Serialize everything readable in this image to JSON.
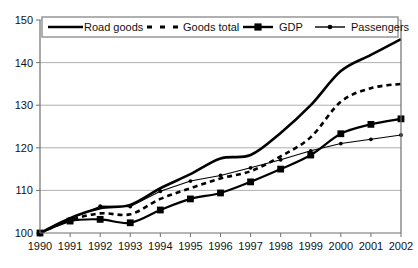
{
  "chart_data": {
    "type": "line",
    "title": "",
    "subtitle": "",
    "xlabel": "",
    "ylabel": "",
    "grid": true,
    "legend_position": "top-inside",
    "x": [
      1990,
      1991,
      1992,
      1993,
      1994,
      1995,
      1996,
      1997,
      1998,
      1999,
      2000,
      2001,
      2002
    ],
    "xtick_labels": [
      "1990",
      "1991",
      "1992",
      "1993",
      "1994",
      "1995",
      "1996",
      "1997",
      "1998",
      "1999",
      "2000",
      "2001",
      "2002"
    ],
    "xlim": [
      1990,
      2002
    ],
    "ylim": [
      100,
      150
    ],
    "ytick_labels": [
      "100",
      "110",
      "120",
      "130",
      "140",
      "150"
    ],
    "yticks": [
      100,
      110,
      120,
      130,
      140,
      150
    ],
    "series": [
      {
        "name": "Road goods",
        "style": "solid-thick",
        "marker": "none",
        "color": "#000000",
        "values": [
          100.0,
          103.5,
          105.8,
          106.6,
          110.5,
          113.8,
          117.5,
          118.3,
          123.5,
          130.0,
          138.0,
          141.8,
          145.5
        ]
      },
      {
        "name": "Goods total",
        "style": "dashed",
        "marker": "none",
        "color": "#000000",
        "values": [
          100.0,
          103.0,
          104.6,
          104.4,
          108.0,
          110.5,
          112.8,
          114.5,
          118.0,
          122.5,
          130.8,
          134.0,
          135.0
        ]
      },
      {
        "name": "GDP",
        "style": "solid",
        "marker": "square",
        "color": "#000000",
        "values": [
          100.0,
          102.8,
          103.2,
          102.4,
          105.4,
          108.0,
          109.4,
          112.0,
          115.0,
          118.3,
          123.3,
          125.5,
          126.8
        ]
      },
      {
        "name": "Passengers",
        "style": "thin",
        "marker": "dot",
        "color": "#000000",
        "values": [
          100.0,
          103.3,
          106.3,
          106.2,
          109.8,
          112.2,
          113.5,
          115.3,
          117.2,
          119.3,
          121.0,
          122.0,
          123.0
        ]
      }
    ]
  },
  "axis": {
    "y_labels": [
      "150",
      "140",
      "130",
      "120",
      "110",
      "100"
    ],
    "x_labels": [
      "1990",
      "1991",
      "1992",
      "1993",
      "1994",
      "1995",
      "1996",
      "1997",
      "1998",
      "1999",
      "2000",
      "2001",
      "2002"
    ]
  },
  "legend": {
    "items": [
      {
        "label": "Road goods",
        "key": "road-goods"
      },
      {
        "label": "Goods total",
        "key": "goods-total"
      },
      {
        "label": "GDP",
        "key": "gdp"
      },
      {
        "label": "Passengers",
        "key": "passengers"
      }
    ]
  },
  "colors": {
    "ink": "#000000",
    "grid": "#9a9a9a",
    "axis": "#6f6f6f",
    "background": "#ffffff"
  }
}
